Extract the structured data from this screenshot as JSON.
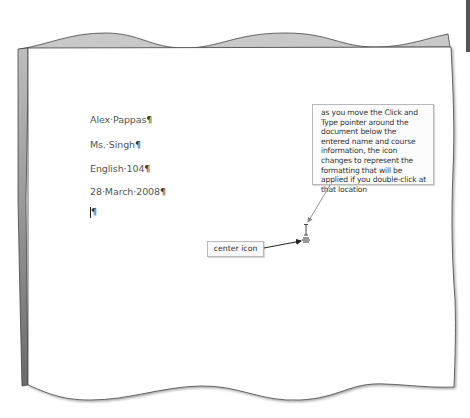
{
  "document": {
    "lines": [
      {
        "text": "Alex·Pappas",
        "mark": "¶"
      },
      {
        "text": "Ms.·Singh",
        "mark": "¶"
      },
      {
        "text": "English·104",
        "mark": "¶"
      },
      {
        "text": "28·March·2008",
        "mark": "¶"
      }
    ],
    "cursor_line_mark": "¶"
  },
  "callouts": {
    "click_and_type": {
      "text": "as you move the Click and Type pointer around the document below the entered name and course information, the icon changes to represent the formatting that will be applied if you double-click at that location"
    },
    "center_icon": {
      "label": "center icon"
    }
  },
  "colors": {
    "page_fill": "#ffffff",
    "torn_edge_fill": "#c8c8c8",
    "left_edge_dark": "#6e6e6e",
    "callout_border": "#b8b8b8",
    "leader_line": "#888888",
    "arrow_line": "#222222"
  }
}
